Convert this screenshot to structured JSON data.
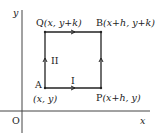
{
  "axes": {
    "x_label": "x",
    "y_label": "y",
    "origin_label": "O"
  },
  "points": {
    "A": {
      "name": "A",
      "coords": "(x, y)"
    },
    "P": {
      "name": "P",
      "coords": "(x+h, y)"
    },
    "Q": {
      "name": "Q",
      "coords": "(x, y+k)"
    },
    "B": {
      "name": "B",
      "coords": "(x+h, y+k)"
    }
  },
  "paths": {
    "I": "I",
    "II": "II"
  },
  "colors": {
    "line": "#222222",
    "background": "#ffffff"
  }
}
